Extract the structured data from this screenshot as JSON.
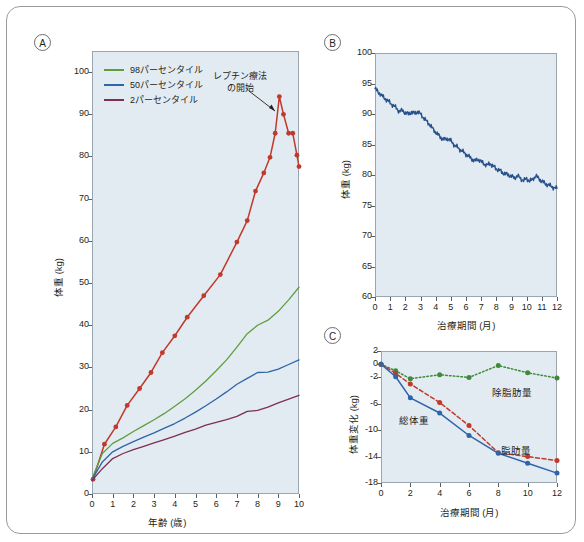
{
  "figure": {
    "panels": [
      "A",
      "B",
      "C"
    ]
  },
  "panelA": {
    "letter": "A",
    "ylabel": "体重 (kg)",
    "xlabel": "年齢 (歳)",
    "yticks": [
      "0",
      "10",
      "20",
      "30",
      "40",
      "50",
      "60",
      "70",
      "80",
      "90",
      "100"
    ],
    "xticks": [
      "0",
      "1",
      "2",
      "3",
      "4",
      "5",
      "6",
      "7",
      "8",
      "9",
      "10"
    ],
    "legend": [
      {
        "label": "98パーセンタイル",
        "color": "#5f9e3f"
      },
      {
        "label": "50パーセンタイル",
        "color": "#2e64a8"
      },
      {
        "label": "2パーセンタイル",
        "color": "#7d2e55"
      }
    ],
    "annotation": {
      "line1": "レプチン療法",
      "line2": "の開始"
    }
  },
  "panelB": {
    "letter": "B",
    "ylabel": "体重 (kg)",
    "xlabel": "治療期間 (月)",
    "yticks": [
      "60",
      "65",
      "70",
      "75",
      "80",
      "85",
      "90",
      "95",
      "100"
    ],
    "xticks": [
      "0",
      "1",
      "2",
      "3",
      "4",
      "5",
      "6",
      "7",
      "8",
      "9",
      "10",
      "11",
      "12"
    ],
    "series_color": "#27518c"
  },
  "panelC": {
    "letter": "C",
    "ylabel": "体重変化 (kg)",
    "xlabel": "治療期間 (月)",
    "yticks": [
      "-18",
      "-14",
      "-10",
      "-6",
      "-2",
      "0",
      "2"
    ],
    "xticks": [
      "0",
      "2",
      "4",
      "6",
      "8",
      "10",
      "12"
    ],
    "labels": {
      "lean": "除脂肪量",
      "total": "総体重",
      "fat": "脂肪量"
    },
    "colors": {
      "lean": "#3f8a3a",
      "total": "#2e64a8",
      "fat": "#c0392b"
    }
  },
  "chart_data": [
    {
      "type": "line",
      "panel": "A",
      "title": "",
      "xlabel": "年齢 (歳)",
      "ylabel": "体重 (kg)",
      "xlim": [
        0,
        10
      ],
      "ylim": [
        0,
        105
      ],
      "grid": false,
      "legend_position": "top-left",
      "annotations": [
        {
          "text": "レプチン療法の開始",
          "x": 9.0,
          "y": 94.0
        }
      ],
      "series": [
        {
          "name": "患者 (患者体重)",
          "color": "#c0392b",
          "markers": true,
          "x": [
            0.05,
            0.6,
            1.15,
            1.7,
            2.3,
            2.85,
            3.4,
            4.0,
            4.6,
            5.4,
            6.2,
            7.0,
            7.5,
            7.9,
            8.3,
            8.6,
            8.85,
            9.05,
            9.25,
            9.5,
            9.7,
            9.9,
            10.0
          ],
          "y": [
            3.5,
            11.8,
            15.9,
            21.0,
            25.0,
            28.8,
            33.5,
            37.5,
            41.9,
            47.0,
            52.0,
            59.7,
            64.8,
            71.8,
            76.1,
            79.8,
            85.5,
            94.2,
            90.0,
            85.5,
            85.5,
            80.3,
            77.6
          ]
        },
        {
          "name": "98パーセンタイル",
          "color": "#5f9e3f",
          "markers": false,
          "x": [
            0,
            0.5,
            1,
            1.5,
            2,
            2.5,
            3,
            3.5,
            4,
            4.5,
            5,
            5.5,
            6,
            6.5,
            7,
            7.5,
            8,
            8.5,
            9,
            9.5,
            10
          ],
          "y": [
            3.6,
            9.6,
            12.0,
            13.3,
            14.8,
            16.2,
            17.6,
            19.1,
            20.8,
            22.6,
            24.6,
            26.8,
            29.2,
            31.8,
            34.8,
            38.0,
            40.0,
            41.2,
            43.3,
            46.0,
            49.0
          ]
        },
        {
          "name": "50パーセンタイル",
          "color": "#2e64a8",
          "markers": false,
          "x": [
            0,
            0.5,
            1,
            1.5,
            2,
            2.5,
            3,
            3.5,
            4,
            4.5,
            5,
            5.5,
            6,
            6.5,
            7,
            7.5,
            8,
            8.5,
            9,
            9.5,
            10
          ],
          "y": [
            3.4,
            7.6,
            10.0,
            11.3,
            12.4,
            13.5,
            14.5,
            15.6,
            16.7,
            18.0,
            19.4,
            20.9,
            22.5,
            24.2,
            26.0,
            27.4,
            28.8,
            28.9,
            29.6,
            30.7,
            31.8
          ]
        },
        {
          "name": "2パーセンタイル",
          "color": "#7d2e55",
          "markers": false,
          "x": [
            0,
            0.5,
            1,
            1.5,
            2,
            2.5,
            3,
            3.5,
            4,
            4.5,
            5,
            5.5,
            6,
            6.5,
            7,
            7.5,
            8,
            8.5,
            9,
            9.5,
            10
          ],
          "y": [
            3.2,
            6.0,
            8.4,
            9.6,
            10.5,
            11.3,
            12.1,
            12.9,
            13.7,
            14.6,
            15.4,
            16.3,
            17.0,
            17.6,
            18.4,
            19.6,
            19.8,
            20.6,
            21.6,
            22.5,
            23.4
          ]
        }
      ]
    },
    {
      "type": "line",
      "panel": "B",
      "title": "",
      "xlabel": "治療期間 (月)",
      "ylabel": "体重 (kg)",
      "xlim": [
        0,
        12
      ],
      "ylim": [
        60,
        100
      ],
      "grid": false,
      "series": [
        {
          "name": "体重",
          "color": "#27518c",
          "markers": false,
          "x": [
            0,
            0.2,
            0.4,
            0.6,
            0.8,
            1.0,
            1.2,
            1.4,
            1.6,
            1.8,
            2.0,
            2.2,
            2.4,
            2.6,
            2.8,
            3.0,
            3.2,
            3.4,
            3.6,
            3.8,
            4.0,
            4.2,
            4.4,
            4.6,
            4.8,
            5.0,
            5.2,
            5.4,
            5.6,
            5.8,
            6.0,
            6.2,
            6.4,
            6.6,
            6.8,
            7.0,
            7.2,
            7.4,
            7.6,
            7.8,
            8.0,
            8.2,
            8.4,
            8.6,
            8.8,
            9.0,
            9.2,
            9.4,
            9.6,
            9.8,
            10.0,
            10.2,
            10.4,
            10.6,
            10.8,
            11.0,
            11.2,
            11.4,
            11.6,
            11.8,
            12.0
          ],
          "y": [
            94.2,
            93.6,
            93.2,
            92.6,
            92.3,
            91.8,
            91.4,
            91.0,
            90.4,
            90.6,
            90.2,
            90.0,
            90.3,
            90.1,
            90.4,
            90.0,
            89.4,
            88.8,
            88.3,
            87.6,
            87.0,
            86.5,
            86.0,
            85.8,
            86.0,
            85.6,
            85.0,
            84.6,
            84.2,
            83.8,
            83.4,
            83.0,
            82.6,
            82.3,
            82.6,
            82.2,
            81.8,
            81.6,
            81.9,
            81.4,
            81.0,
            80.8,
            80.4,
            80.2,
            80.0,
            79.8,
            79.5,
            79.9,
            79.4,
            79.1,
            79.4,
            79.0,
            79.3,
            79.9,
            79.4,
            79.0,
            78.6,
            78.4,
            78.2,
            77.9,
            77.8
          ]
        }
      ]
    },
    {
      "type": "line",
      "panel": "C",
      "title": "",
      "xlabel": "治療期間 (月)",
      "ylabel": "体重変化 (kg)",
      "xlim": [
        0,
        12
      ],
      "ylim": [
        -18,
        2
      ],
      "grid": false,
      "series": [
        {
          "name": "除脂肪量",
          "color": "#3f8a3a",
          "style": "dotted",
          "markers": true,
          "x": [
            0,
            1,
            2,
            4,
            6,
            8,
            10,
            12
          ],
          "y": [
            0.0,
            -1.0,
            -2.2,
            -1.6,
            -2.0,
            -0.2,
            -1.3,
            -2.1
          ]
        },
        {
          "name": "脂肪量",
          "color": "#c0392b",
          "style": "dashed",
          "markers": true,
          "x": [
            0,
            1,
            2,
            4,
            6,
            8,
            10,
            12
          ],
          "y": [
            0.0,
            -1.4,
            -3.0,
            -5.8,
            -9.3,
            -13.4,
            -14.0,
            -14.6
          ]
        },
        {
          "name": "総体重",
          "color": "#2e64a8",
          "style": "solid",
          "markers": true,
          "x": [
            0,
            1,
            2,
            4,
            6,
            8,
            10,
            12
          ],
          "y": [
            0.0,
            -1.9,
            -5.1,
            -7.4,
            -10.8,
            -13.5,
            -15.0,
            -16.5
          ]
        }
      ]
    }
  ]
}
